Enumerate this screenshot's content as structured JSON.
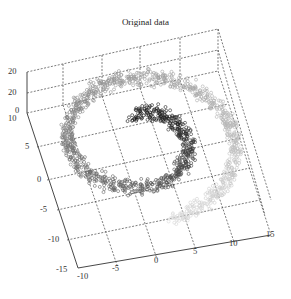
{
  "chart_data": {
    "type": "scatter",
    "dimensions": 3,
    "title": "Original data",
    "xlabel": "",
    "ylabel": "",
    "zlabel": "",
    "x_ticks": [
      "-10",
      "-5",
      "0",
      "5",
      "10",
      "15"
    ],
    "xlim": [
      -10,
      15
    ],
    "y_ticks": [
      "10",
      "5",
      "0",
      "-5",
      "-10",
      "-15"
    ],
    "ylim": [
      -15,
      10
    ],
    "z_ticks": [
      "20",
      "20",
      "0"
    ],
    "zlim": [
      0,
      20
    ],
    "grid": true,
    "legend": null,
    "color_scale": {
      "start": "#d8d8d8",
      "end": "#111111"
    },
    "series": [
      {
        "name": "swiss-roll",
        "shape": "spiral",
        "turns": 1.5,
        "t_range": [
          4.7,
          14.1
        ],
        "center": [
          2.5,
          2
        ],
        "points_estimate": 2000
      }
    ]
  }
}
